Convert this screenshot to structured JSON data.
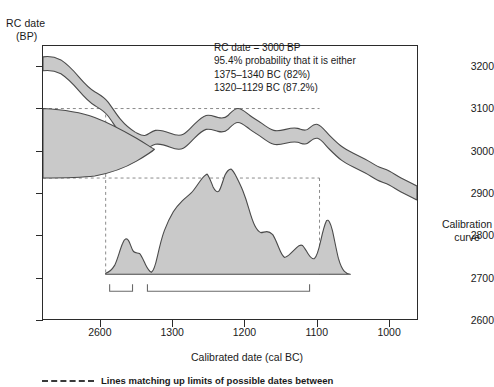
{
  "yaxis": {
    "title_line1": "RC date",
    "title_line2": "(BP)",
    "ticks": [
      {
        "label": "3200",
        "value": 3200
      },
      {
        "label": "3100",
        "value": 3100
      },
      {
        "label": "3000",
        "value": 3000
      },
      {
        "label": "2900",
        "value": 2900
      },
      {
        "label": "2800",
        "value": 2800
      },
      {
        "label": "2700",
        "value": 2700
      },
      {
        "label": "2600",
        "value": 2600
      }
    ]
  },
  "xaxis": {
    "title": "Calibrated date (cal BC)",
    "ticks": [
      {
        "label": "2600",
        "value": 1400
      },
      {
        "label": "1300",
        "value": 1300
      },
      {
        "label": "1200",
        "value": 1200
      },
      {
        "label": "1100",
        "value": 1100
      },
      {
        "label": "1000",
        "value": 1000
      }
    ]
  },
  "annotation": {
    "line1": "RC date = 3000 BP",
    "line2": "95.4% probability that it is either",
    "line3": "1375–1340 BC (82%)",
    "line4": "1320–1129 BC (87.2%)"
  },
  "curve_label": {
    "line1": "Calibration",
    "line2": "curve"
  },
  "footnote": {
    "text": "Lines matching up limits of possible dates between"
  },
  "colors": {
    "band_fill": "#c9c9c9",
    "band_stroke": "#4a4a4a",
    "axis": "#2b2b2b",
    "dashed_guide": "#8a8a8a",
    "text": "#1a1a1a"
  },
  "chart_data": {
    "type": "area",
    "title": "",
    "xlabel": "Calibrated date (cal BC)",
    "ylabel": "RC date (BP)",
    "xlim": [
      1480,
      960
    ],
    "ylim": [
      2600,
      3250
    ],
    "x_reversed": true,
    "grid": false,
    "legend": "none",
    "series": [
      {
        "name": "Calibration curve (upper limit)",
        "type": "line",
        "x": [
          1480,
          1470,
          1460,
          1450,
          1440,
          1430,
          1420,
          1410,
          1400,
          1392,
          1385,
          1378,
          1370,
          1362,
          1355,
          1348,
          1340,
          1332,
          1325,
          1318,
          1310,
          1302,
          1295,
          1288,
          1280,
          1272,
          1265,
          1258,
          1250,
          1242,
          1235,
          1228,
          1220,
          1212,
          1205,
          1198,
          1190,
          1182,
          1175,
          1168,
          1160,
          1152,
          1145,
          1138,
          1130,
          1122,
          1115,
          1108,
          1100,
          1090,
          1080,
          1070,
          1060,
          1050,
          1040,
          1030,
          1020,
          1010,
          1000,
          990,
          980,
          970,
          960
        ],
        "y": [
          3215,
          3216,
          3213,
          3208,
          3200,
          3190,
          3180,
          3170,
          3160,
          3152,
          3148,
          3142,
          3132,
          3122,
          3112,
          3104,
          3098,
          3092,
          3084,
          3078,
          3074,
          3072,
          3074,
          3078,
          3082,
          3084,
          3082,
          3076,
          3068,
          3060,
          3054,
          3050,
          3048,
          3050,
          3054,
          3058,
          3058,
          3052,
          3046,
          3040,
          3034,
          3028,
          3024,
          3022,
          3026,
          3030,
          3026,
          3018,
          3010,
          3000,
          2992,
          2988,
          2986,
          2984,
          2980,
          2974,
          2966,
          2958,
          2952,
          2946,
          2940,
          2934,
          2928
        ]
      },
      {
        "name": "Calibration curve (lower limit)",
        "type": "line",
        "x": [
          1480,
          1470,
          1460,
          1450,
          1440,
          1430,
          1420,
          1410,
          1400,
          1392,
          1385,
          1378,
          1370,
          1362,
          1355,
          1348,
          1340,
          1332,
          1325,
          1318,
          1310,
          1302,
          1295,
          1288,
          1280,
          1272,
          1265,
          1258,
          1250,
          1242,
          1235,
          1228,
          1220,
          1212,
          1205,
          1198,
          1190,
          1182,
          1175,
          1168,
          1160,
          1152,
          1145,
          1138,
          1130,
          1122,
          1115,
          1108,
          1100,
          1090,
          1080,
          1070,
          1060,
          1050,
          1040,
          1030,
          1020,
          1010,
          1000,
          990,
          980,
          970,
          960
        ],
        "y": [
          3190,
          3192,
          3190,
          3186,
          3178,
          3168,
          3158,
          3148,
          3138,
          3130,
          3126,
          3120,
          3110,
          3100,
          3090,
          3082,
          3076,
          3070,
          3062,
          3056,
          3052,
          3050,
          3052,
          3056,
          3060,
          3062,
          3060,
          3054,
          3046,
          3038,
          3032,
          3028,
          3026,
          3028,
          3032,
          3036,
          3036,
          3030,
          3024,
          3018,
          3012,
          3006,
          3002,
          3000,
          3004,
          3008,
          3004,
          2996,
          2988,
          2978,
          2970,
          2966,
          2964,
          2962,
          2958,
          2952,
          2944,
          2936,
          2930,
          2924,
          2918,
          2912,
          2906
        ]
      },
      {
        "name": "RC date probability distribution (vertical, left)",
        "type": "area",
        "orientation": "horizontal",
        "peak_y": 3000,
        "y_range": [
          2918,
          3075
        ],
        "description": "Teardrop-shaped Gaussian on the RC-date axis centred at 3000 BP"
      },
      {
        "name": "Calibrated date probability distribution (bottom)",
        "type": "area",
        "x": [
          1398,
          1392,
          1386,
          1380,
          1375,
          1370,
          1364,
          1358,
          1352,
          1346,
          1340,
          1334,
          1328,
          1322,
          1316,
          1310,
          1304,
          1298,
          1292,
          1286,
          1280,
          1274,
          1268,
          1262,
          1256,
          1250,
          1244,
          1238,
          1232,
          1226,
          1220,
          1214,
          1208,
          1202,
          1196,
          1190,
          1184,
          1178,
          1172,
          1166,
          1160,
          1154,
          1148,
          1142,
          1136,
          1130,
          1124,
          1118,
          1112,
          1106,
          1100
        ],
        "y": [
          0,
          2,
          6,
          16,
          30,
          26,
          22,
          24,
          20,
          12,
          8,
          6,
          10,
          26,
          46,
          62,
          70,
          76,
          84,
          88,
          92,
          86,
          96,
          100,
          92,
          82,
          88,
          96,
          98,
          90,
          72,
          56,
          50,
          54,
          50,
          40,
          28,
          24,
          26,
          34,
          36,
          30,
          22,
          18,
          22,
          44,
          64,
          50,
          26,
          10,
          2
        ],
        "ylabel": "relative probability"
      }
    ],
    "guides": {
      "horizontal_dashed": [
        3075,
        2918
      ],
      "vertical_dashed": [
        1398,
        1100
      ],
      "description": "Dashed lines match the limits of the RC-date distribution across to the calibration curve and down to the calibrated-date axis"
    },
    "ranges": [
      {
        "label": "1375–1340 BC",
        "probability": "82%",
        "from": 1375,
        "to": 1340
      },
      {
        "label": "1320–1129 BC",
        "probability": "87.2%",
        "from": 1320,
        "to": 1129
      }
    ]
  }
}
